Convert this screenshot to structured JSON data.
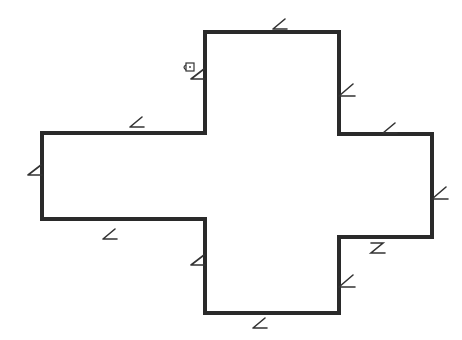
{
  "diagram": {
    "type": "floor-plan-outline",
    "stroke_color": "#2a2a2a",
    "background": "#ffffff",
    "stroke_width": 4,
    "outline_points": [
      [
        205,
        32
      ],
      [
        339,
        32
      ],
      [
        339,
        134
      ],
      [
        432,
        134
      ],
      [
        432,
        237
      ],
      [
        339,
        237
      ],
      [
        339,
        313
      ],
      [
        205,
        313
      ],
      [
        205,
        219
      ],
      [
        42,
        219
      ],
      [
        42,
        133
      ],
      [
        205,
        133
      ]
    ],
    "edge_symbols": [
      {
        "name": "top-edge",
        "icon": "angle-symbol",
        "x": 282,
        "y": 26,
        "orient": "h-above"
      },
      {
        "name": "right-upper-vertical",
        "icon": "angle-symbol",
        "x": 347,
        "y": 93,
        "orient": "v-right"
      },
      {
        "name": "right-arm-top",
        "icon": "angle-symbol",
        "x": 392,
        "y": 130,
        "orient": "h-above"
      },
      {
        "name": "right-arm-end",
        "icon": "angle-symbol",
        "x": 440,
        "y": 196,
        "orient": "v-right"
      },
      {
        "name": "right-arm-bottom",
        "icon": "angle-symbol",
        "x": 378,
        "y": 248,
        "orient": "h-below-z"
      },
      {
        "name": "right-lower-vertical",
        "icon": "angle-symbol",
        "x": 347,
        "y": 284,
        "orient": "v-right"
      },
      {
        "name": "bottom-edge",
        "icon": "angle-symbol",
        "x": 262,
        "y": 325,
        "orient": "h-below"
      },
      {
        "name": "left-lower-vertical",
        "icon": "angle-symbol",
        "x": 198,
        "y": 262,
        "orient": "v-left"
      },
      {
        "name": "left-arm-bottom",
        "icon": "angle-symbol",
        "x": 112,
        "y": 236,
        "orient": "h-below"
      },
      {
        "name": "left-arm-end",
        "icon": "angle-symbol",
        "x": 35,
        "y": 172,
        "orient": "v-left"
      },
      {
        "name": "left-arm-top",
        "icon": "angle-symbol",
        "x": 139,
        "y": 124,
        "orient": "h-above"
      },
      {
        "name": "left-upper-vertical",
        "icon": "angle-symbol",
        "x": 198,
        "y": 76,
        "orient": "v-left"
      }
    ],
    "lock_icon": {
      "icon": "lock-icon",
      "x": 189,
      "y": 67
    }
  }
}
